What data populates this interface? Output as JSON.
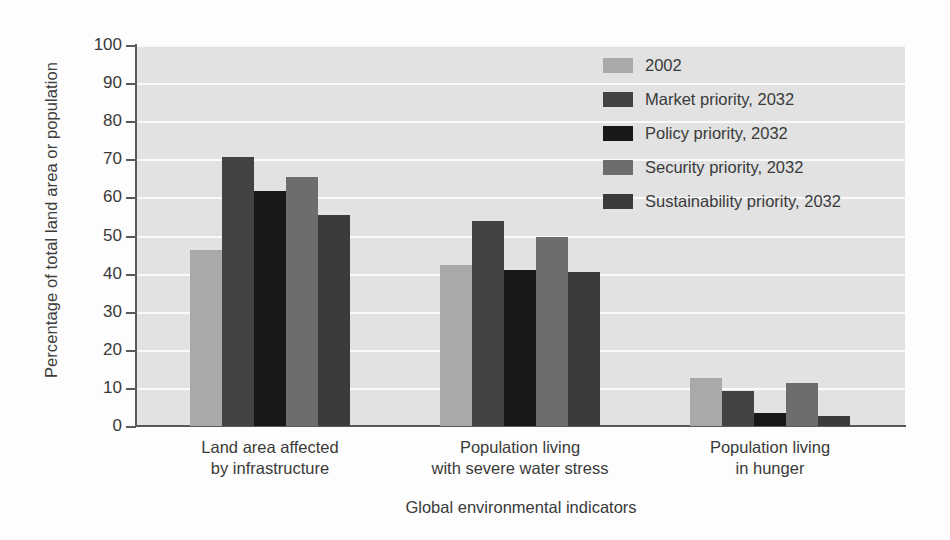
{
  "chart_data": {
    "type": "bar",
    "title": "",
    "xlabel": "Global environmental indicators",
    "ylabel": "Percentage of total land area or population",
    "ylim": [
      0,
      100
    ],
    "yticks": [
      0,
      10,
      20,
      30,
      40,
      50,
      60,
      70,
      80,
      90,
      100
    ],
    "grid": true,
    "legend_position": "top-right",
    "categories": [
      "Land area affected by infrastructure",
      "Population living with severe water stress",
      "Population living in hunger"
    ],
    "category_lines": [
      [
        "Land area affected",
        "by infrastructure"
      ],
      [
        "Population living",
        "with severe water stress"
      ],
      [
        "Population living",
        "in hunger"
      ]
    ],
    "series": [
      {
        "name": "2002",
        "color": "#a9a9a9",
        "values": [
          46.2,
          42.3,
          12.7
        ]
      },
      {
        "name": "Market priority, 2032",
        "color": "#434343",
        "values": [
          70.5,
          53.8,
          9.2
        ]
      },
      {
        "name": "Policy priority, 2032",
        "color": "#181818",
        "values": [
          61.8,
          41.0,
          3.5
        ]
      },
      {
        "name": "Security priority, 2032",
        "color": "#6d6d6d",
        "values": [
          65.3,
          49.5,
          11.4
        ]
      },
      {
        "name": "Sustainability priority, 2032",
        "color": "#3b3b3b",
        "values": [
          55.5,
          40.3,
          2.6
        ]
      }
    ],
    "plot_background": "#e2e2e2",
    "gridline_color": "#fafafa",
    "axis_color": "#5a5a5a"
  },
  "axis": {
    "y_title": "Percentage of total land area or population",
    "x_title": "Global environmental indicators",
    "tick_labels": [
      "0",
      "10",
      "20",
      "30",
      "40",
      "50",
      "60",
      "70",
      "80",
      "90",
      "100"
    ]
  }
}
